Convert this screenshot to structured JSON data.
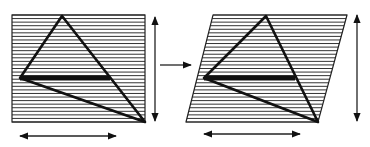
{
  "diagram": {
    "colors": {
      "stroke": "#111111",
      "hatch": "#333333",
      "background": "#ffffff"
    },
    "left_figure": {
      "shape": "rectangle",
      "hatch_lines": 30,
      "triangle": "apex top, left vertex mid-left, right vertex bottom-right",
      "thick_segment": "horizontal base from left vertex to right side of triangle"
    },
    "transform_arrow": {
      "direction": "right"
    },
    "right_figure": {
      "shape": "parallelogram (sheared rectangle)",
      "hatch_lines": 30
    },
    "dimension_arrows": [
      {
        "id": "left-height",
        "orientation": "vertical"
      },
      {
        "id": "left-width",
        "orientation": "horizontal"
      },
      {
        "id": "right-height",
        "orientation": "vertical"
      },
      {
        "id": "right-width",
        "orientation": "horizontal"
      }
    ]
  }
}
